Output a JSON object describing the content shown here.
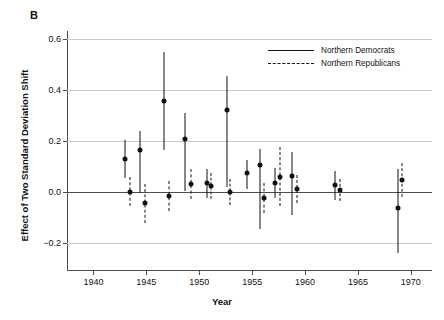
{
  "panel": {
    "letter": "B"
  },
  "chart_data": {
    "type": "scatter",
    "title": "",
    "xlabel": "Year",
    "ylabel": "Effect of Two Standard Deviation Shift",
    "xlim": [
      1937.5,
      1972
    ],
    "ylim": [
      -0.31,
      0.63
    ],
    "xticks": [
      1940,
      1945,
      1950,
      1955,
      1960,
      1965,
      1970
    ],
    "yticks": [
      -0.2,
      0.0,
      0.2,
      0.4,
      0.6
    ],
    "ytick_labels": [
      "−0.2",
      "0.0",
      "0.2",
      "0.4",
      "0.6"
    ],
    "grid": "horizontal",
    "zero_line": 0.0,
    "legend_position": "top-right",
    "series": [
      {
        "name": "Northern Democrats",
        "style": "solid",
        "marker": "filled-circle",
        "color": "#111111",
        "points": [
          {
            "x": 1943.0,
            "y": 0.13,
            "lo": 0.055,
            "hi": 0.205
          },
          {
            "x": 1944.4,
            "y": 0.163,
            "lo": -0.005,
            "hi": 0.237
          },
          {
            "x": 1946.7,
            "y": 0.355,
            "lo": 0.163,
            "hi": 0.547
          },
          {
            "x": 1948.7,
            "y": 0.208,
            "lo": 0.003,
            "hi": 0.307
          },
          {
            "x": 1950.7,
            "y": 0.033,
            "lo": -0.023,
            "hi": 0.09
          },
          {
            "x": 1952.6,
            "y": 0.322,
            "lo": 0.02,
            "hi": 0.452
          },
          {
            "x": 1954.5,
            "y": 0.073,
            "lo": 0.013,
            "hi": 0.124
          },
          {
            "x": 1955.7,
            "y": 0.105,
            "lo": -0.145,
            "hi": 0.168
          },
          {
            "x": 1957.2,
            "y": 0.033,
            "lo": -0.023,
            "hi": 0.094
          },
          {
            "x": 1958.8,
            "y": 0.062,
            "lo": -0.09,
            "hi": 0.155
          },
          {
            "x": 1962.8,
            "y": 0.026,
            "lo": -0.03,
            "hi": 0.082
          },
          {
            "x": 1968.8,
            "y": -0.063,
            "lo": -0.238,
            "hi": 0.088
          }
        ]
      },
      {
        "name": "Northern Republicans",
        "style": "dashed",
        "marker": "filled-circle",
        "color": "#111111",
        "points": [
          {
            "x": 1943.5,
            "y": 0.0,
            "lo": -0.055,
            "hi": 0.06
          },
          {
            "x": 1944.9,
            "y": -0.045,
            "lo": -0.122,
            "hi": 0.032
          },
          {
            "x": 1947.1,
            "y": -0.015,
            "lo": -0.075,
            "hi": 0.043
          },
          {
            "x": 1949.2,
            "y": 0.03,
            "lo": -0.028,
            "hi": 0.088
          },
          {
            "x": 1951.1,
            "y": 0.021,
            "lo": -0.03,
            "hi": 0.072
          },
          {
            "x": 1952.9,
            "y": 0.0,
            "lo": -0.052,
            "hi": 0.052
          },
          {
            "x": 1555.0,
            "y": 0.082,
            "lo": -0.01,
            "hi": 0.168
          },
          {
            "x": 1956.1,
            "y": -0.023,
            "lo": -0.083,
            "hi": 0.035
          },
          {
            "x": 1957.6,
            "y": 0.06,
            "lo": -0.055,
            "hi": 0.175
          },
          {
            "x": 1959.2,
            "y": 0.012,
            "lo": -0.042,
            "hi": 0.066
          },
          {
            "x": 1963.3,
            "y": 0.008,
            "lo": -0.035,
            "hi": 0.052
          },
          {
            "x": 1969.2,
            "y": 0.045,
            "lo": -0.02,
            "hi": 0.112
          }
        ]
      }
    ]
  },
  "legend": {
    "entries": [
      {
        "label": "Northern Democrats",
        "style": "solid"
      },
      {
        "label": "Northern Republicans",
        "style": "dashed"
      }
    ]
  }
}
